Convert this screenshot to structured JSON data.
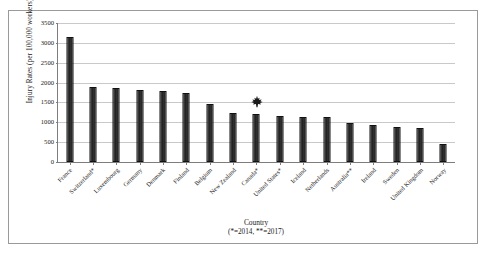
{
  "chart_data": {
    "type": "bar",
    "title": "",
    "xlabel": "Country",
    "xlabel_note": "(*=2014, **=2017)",
    "ylabel": "Injury Rates (per 100,000 workers)",
    "ylim": [
      0,
      3500
    ],
    "yticks": [
      0,
      500,
      1000,
      1500,
      2000,
      2500,
      3000,
      3500
    ],
    "ytick_labels": [
      "0",
      "500",
      "1000",
      "1500",
      "2000",
      "2500",
      "3000",
      "3500"
    ],
    "grid": true,
    "legend": "none",
    "bar_color": "#222222",
    "categories": [
      "France",
      "Switzerland*",
      "Luxembourg",
      "Germany",
      "Denmark",
      "Finland",
      "Belgium",
      "New Zealand",
      "Canada*",
      "United States*",
      "Iceland",
      "Netherlands",
      "Australia**",
      "Ireland",
      "Sweden",
      "United Kingdom",
      "Norway"
    ],
    "values": [
      3150,
      1890,
      1870,
      1810,
      1795,
      1740,
      1450,
      1240,
      1220,
      1150,
      1140,
      1140,
      975,
      930,
      890,
      855,
      450
    ],
    "annotations": [
      {
        "type": "maple-leaf-icon",
        "category": "Canada*",
        "value": 1220,
        "note": "Canada highlighted with maple leaf marker"
      }
    ]
  },
  "figure": {
    "frame_border_color": "#9a9a9a",
    "axis_color": "#7d7d7d",
    "gridline_color": "#c9c9c9",
    "background": "#ffffff"
  }
}
